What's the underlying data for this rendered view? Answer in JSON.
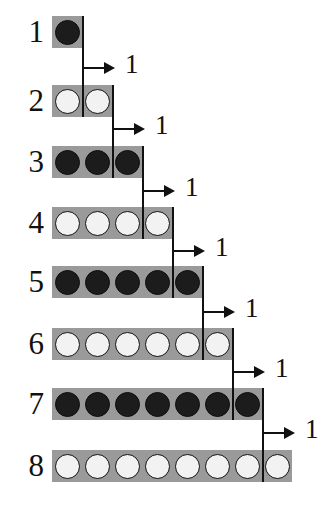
{
  "figure": {
    "background_color": "#ffffff",
    "bar_color": "#9a9a9a",
    "dark_disc_color": "#1c1c1c",
    "light_disc_color": "#f2f2f2",
    "line_color": "#111111",
    "cell_size": 30,
    "bar_left": 52,
    "rows": [
      {
        "label": "1",
        "count": 1,
        "fill": "dark",
        "y": 16,
        "height": 32
      },
      {
        "label": "2",
        "count": 2,
        "fill": "light",
        "y": 85,
        "height": 32
      },
      {
        "label": "3",
        "count": 3,
        "fill": "dark",
        "y": 146,
        "height": 32
      },
      {
        "label": "4",
        "count": 4,
        "fill": "light",
        "y": 207,
        "height": 32
      },
      {
        "label": "5",
        "count": 5,
        "fill": "dark",
        "y": 266,
        "height": 32
      },
      {
        "label": "6",
        "count": 6,
        "fill": "light",
        "y": 328,
        "height": 32
      },
      {
        "label": "7",
        "count": 7,
        "fill": "dark",
        "y": 388,
        "height": 32
      },
      {
        "label": "8",
        "count": 8,
        "fill": "light",
        "y": 450,
        "height": 32
      }
    ],
    "increments": [
      {
        "label": "1",
        "from_row": 1,
        "to_row": 2,
        "x": 82,
        "y": 67
      },
      {
        "label": "1",
        "from_row": 2,
        "to_row": 3,
        "x": 112,
        "y": 128
      },
      {
        "label": "1",
        "from_row": 3,
        "to_row": 4,
        "x": 142,
        "y": 190
      },
      {
        "label": "1",
        "from_row": 4,
        "to_row": 5,
        "x": 172,
        "y": 250
      },
      {
        "label": "1",
        "from_row": 5,
        "to_row": 6,
        "x": 202,
        "y": 311
      },
      {
        "label": "1",
        "from_row": 6,
        "to_row": 7,
        "x": 232,
        "y": 371
      },
      {
        "label": "1",
        "from_row": 7,
        "to_row": 8,
        "x": 262,
        "y": 432
      }
    ]
  }
}
